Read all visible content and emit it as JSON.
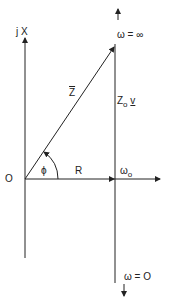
{
  "diagram": {
    "type": "impedance phasor diagram",
    "axes": {
      "vertical_label": "j X",
      "origin_label": "O",
      "horizontal_label": "R"
    },
    "vector": {
      "label": "Z",
      "angle_label": "ϕ"
    },
    "locus": {
      "label_prefix": "Z",
      "label_sub": "o",
      "label_var": "v",
      "top_label": "ω = ∞",
      "bottom_label": "ω = O",
      "resonance_label": "ω",
      "resonance_sub": "o"
    },
    "colors": {
      "line": "#222222",
      "background": "#ffffff"
    }
  }
}
